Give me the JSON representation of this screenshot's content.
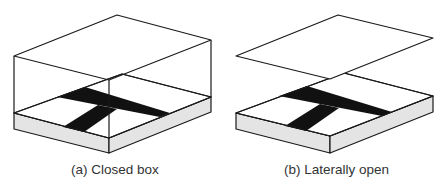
{
  "figure": {
    "panels": [
      {
        "id": "a",
        "caption": "(a) Closed box",
        "lid": "closed",
        "components": [
          "lid",
          "transparent side walls",
          "base plate",
          "T-shaped dark conductor on base"
        ]
      },
      {
        "id": "b",
        "caption": "(b) Laterally open",
        "lid": "floating above base, no side walls",
        "components": [
          "lid",
          "base plate",
          "T-shaped dark conductor on base"
        ]
      }
    ],
    "colors": {
      "line": "#1a1a1a",
      "base_side": "#e4e4e4",
      "conductor": "#111111",
      "background": "#ffffff"
    }
  }
}
